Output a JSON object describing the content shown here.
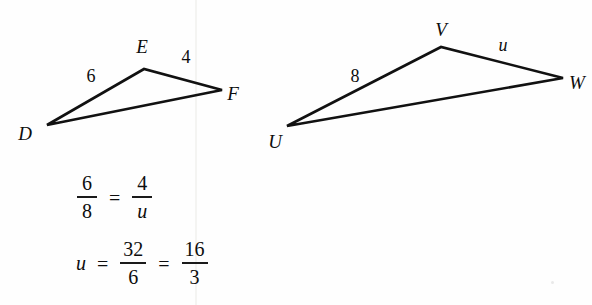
{
  "figure": {
    "stroke_color": "#111111",
    "background_color": "#fefefe",
    "triangles": [
      {
        "name": "triangle-def",
        "vertices": [
          {
            "label": "D",
            "x": 47,
            "y": 125,
            "label_x": 25,
            "label_y": 133
          },
          {
            "label": "E",
            "x": 144,
            "y": 69,
            "label_x": 142,
            "label_y": 46
          },
          {
            "label": "F",
            "x": 222,
            "y": 90,
            "label_x": 233,
            "label_y": 93
          }
        ],
        "side_labels": [
          {
            "name": "side-de-length",
            "text": "6",
            "x": 91,
            "y": 76,
            "italic": false
          },
          {
            "name": "side-ef-length",
            "text": "4",
            "x": 186,
            "y": 57,
            "italic": false
          }
        ]
      },
      {
        "name": "triangle-uvw",
        "vertices": [
          {
            "label": "U",
            "x": 287,
            "y": 126,
            "label_x": 275,
            "label_y": 141
          },
          {
            "label": "V",
            "x": 441,
            "y": 47,
            "label_x": 441,
            "label_y": 29
          },
          {
            "label": "W",
            "x": 563,
            "y": 78,
            "label_x": 577,
            "label_y": 82
          }
        ],
        "side_labels": [
          {
            "name": "side-uv-length",
            "text": "8",
            "x": 355,
            "y": 76,
            "italic": false
          },
          {
            "name": "side-vw-length",
            "text": "u",
            "x": 503,
            "y": 45,
            "italic": true
          }
        ]
      }
    ]
  },
  "equations": [
    {
      "name": "proportion-equation",
      "x": 74,
      "y": 172,
      "parts": [
        {
          "kind": "fraction",
          "num": "6",
          "den": "8",
          "num_italic": false,
          "den_italic": false
        },
        {
          "kind": "operator",
          "text": "="
        },
        {
          "kind": "fraction",
          "num": "4",
          "den": "u",
          "num_italic": false,
          "den_italic": true
        }
      ]
    },
    {
      "name": "solution-equation",
      "x": 74,
      "y": 238,
      "parts": [
        {
          "kind": "term",
          "text": "u",
          "italic": true
        },
        {
          "kind": "operator",
          "text": "="
        },
        {
          "kind": "fraction",
          "num": "32",
          "den": "6",
          "num_italic": false,
          "den_italic": false
        },
        {
          "kind": "operator",
          "text": "="
        },
        {
          "kind": "fraction",
          "num": "16",
          "den": "3",
          "num_italic": false,
          "den_italic": false
        }
      ]
    }
  ],
  "artifacts": {
    "seam_x": 195,
    "speck": {
      "x": 551,
      "y": 281,
      "size": 3
    }
  }
}
